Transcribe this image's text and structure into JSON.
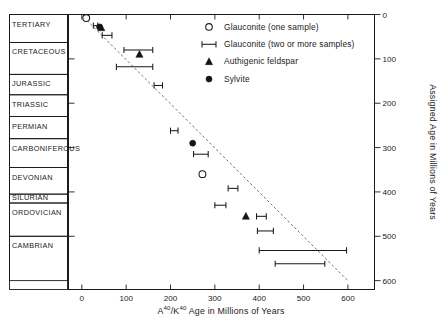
{
  "figure": {
    "title_visible": false,
    "colors": {
      "ink": "#1a1a1a",
      "trend": "#6b6b6b",
      "marker_fill": "#141414",
      "background": "#ffffff"
    }
  },
  "x_axis": {
    "title_main": "Age in Millions of Years",
    "title_prefix_a": "A",
    "title_sup_a": "40",
    "title_slash": "/K",
    "title_sup_k": "40",
    "title_full": "A40/K40 Age in Millions of Years",
    "ticks": [
      0,
      100,
      200,
      300,
      400,
      500,
      600
    ],
    "tick_labels": [
      "0",
      "100",
      "200",
      "300",
      "400",
      "500",
      "600"
    ],
    "min": -30,
    "max": 660
  },
  "y_axis_right": {
    "title": "Assigned Age in Millions of Years",
    "ticks": [
      0,
      100,
      200,
      300,
      400,
      500,
      600
    ],
    "tick_labels": [
      "0",
      "100",
      "200",
      "300",
      "400",
      "500",
      "600"
    ],
    "min": 0,
    "max": 620,
    "inverted": true
  },
  "geologic_periods": [
    {
      "name": "TERTIARY",
      "top": 0,
      "bottom": 63
    },
    {
      "name": "CRETACEOUS",
      "top": 63,
      "bottom": 135
    },
    {
      "name": "JURASSIC",
      "top": 135,
      "bottom": 181
    },
    {
      "name": "TRIASSIC",
      "top": 181,
      "bottom": 230
    },
    {
      "name": "PERMIAN",
      "top": 230,
      "bottom": 280
    },
    {
      "name": "CARBONIFEROUS",
      "top": 280,
      "bottom": 345
    },
    {
      "name": "DEVONIAN",
      "top": 345,
      "bottom": 405
    },
    {
      "name": "SILURIAN",
      "top": 405,
      "bottom": 425
    },
    {
      "name": "ORDOVICIAN",
      "top": 425,
      "bottom": 500
    },
    {
      "name": "CAMBRIAN",
      "top": 500,
      "bottom": 600
    }
  ],
  "legend": {
    "items": [
      {
        "marker": "open-circle-icon",
        "label": "Glauconite (one sample)"
      },
      {
        "marker": "error-bar-icon",
        "label": "Glauconite (two or more samples)"
      },
      {
        "marker": "triangle-icon",
        "label": "Authigenic feldspar"
      },
      {
        "marker": "filled-circle-icon",
        "label": "Sylvite"
      }
    ]
  },
  "chart_data": {
    "type": "scatter",
    "title": "",
    "xlabel": "A40/K40 Age in Millions of Years",
    "ylabel": "Assigned Age in Millions of Years",
    "xlim": [
      -30,
      660
    ],
    "ylim": [
      0,
      620
    ],
    "y_inverted": true,
    "grid": false,
    "legend_position": "top-right",
    "trend_line": {
      "style": "dashed",
      "label": "1:1 correlation",
      "x_start": 12,
      "y_start": 14,
      "x_end": 600,
      "y_end": 600
    },
    "series": [
      {
        "name": "Glauconite (one sample)",
        "marker": "open-circle",
        "points": [
          {
            "x": 10,
            "y": 8
          },
          {
            "x": 272,
            "y": 360
          }
        ]
      },
      {
        "name": "Glauconite (two or more samples)",
        "marker": "error-bar",
        "points": [
          {
            "x": 30,
            "y": 25,
            "x_low": 26,
            "x_high": 36
          },
          {
            "x": 57,
            "y": 47,
            "x_low": 46,
            "x_high": 68
          },
          {
            "x": 128,
            "y": 80,
            "x_low": 95,
            "x_high": 160
          },
          {
            "x": 120,
            "y": 118,
            "x_low": 78,
            "x_high": 160
          },
          {
            "x": 172,
            "y": 160,
            "x_low": 163,
            "x_high": 182
          },
          {
            "x": 208,
            "y": 262,
            "x_low": 200,
            "x_high": 217
          },
          {
            "x": 268,
            "y": 315,
            "x_low": 252,
            "x_high": 285
          },
          {
            "x": 340,
            "y": 392,
            "x_low": 330,
            "x_high": 352
          },
          {
            "x": 312,
            "y": 430,
            "x_low": 300,
            "x_high": 325
          },
          {
            "x": 404,
            "y": 455,
            "x_low": 394,
            "x_high": 416
          },
          {
            "x": 414,
            "y": 488,
            "x_low": 396,
            "x_high": 432
          },
          {
            "x": 498,
            "y": 532,
            "x_low": 400,
            "x_high": 597
          },
          {
            "x": 492,
            "y": 562,
            "x_low": 436,
            "x_high": 548
          }
        ]
      },
      {
        "name": "Authigenic feldspar",
        "marker": "triangle",
        "points": [
          {
            "x": 44,
            "y": 30
          },
          {
            "x": 130,
            "y": 90
          },
          {
            "x": 370,
            "y": 455
          }
        ]
      },
      {
        "name": "Sylvite",
        "marker": "filled-circle",
        "points": [
          {
            "x": 40,
            "y": 28
          },
          {
            "x": 250,
            "y": 290
          }
        ]
      }
    ]
  }
}
